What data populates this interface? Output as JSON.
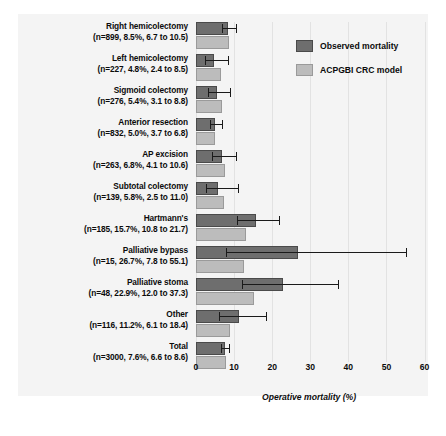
{
  "chart_data": {
    "type": "bar",
    "orientation": "horizontal",
    "title": "",
    "xlabel": "Operative mortality (%)",
    "ylabel": "",
    "xlim": [
      0,
      63
    ],
    "xticks": [
      0,
      10,
      20,
      30,
      40,
      50,
      60
    ],
    "grid": true,
    "legend_position": "top-right",
    "categories": [
      "Right hemicolectomy",
      "Left hemicolectomy",
      "Sigmoid colectomy",
      "Anterior resection",
      "AP excision",
      "Subtotal colectomy",
      "Hartmann's",
      "Palliative bypass",
      "Palliative stoma",
      "Other",
      "Total"
    ],
    "sublabels": [
      "(n=899, 8.5%, 6.7 to 10.5)",
      "(n=227, 4.8%, 2.4 to 8.5)",
      "(n=276, 5.4%, 3.1 to 8.8)",
      "(n=832, 5.0%, 3.7 to 6.8)",
      "(n=263, 6.8%, 4.1 to 10.6)",
      "(n=139, 5.8%, 2.5 to 11.0)",
      "(n=185, 15.7%, 10.8 to 21.7)",
      "(n=15, 26.7%, 7.8 to 55.1)",
      "(n=48, 22.9%, 12.0 to 37.3)",
      "(n=116, 11.2%, 6.1 to 18.4)",
      "(n=3000, 7.6%, 6.6 to 8.6)"
    ],
    "n": [
      899,
      227,
      276,
      832,
      263,
      139,
      185,
      15,
      48,
      116,
      3000
    ],
    "series": [
      {
        "name": "Observed mortality",
        "color": "#6e6e6e",
        "values": [
          8.5,
          4.8,
          5.4,
          5.0,
          6.8,
          5.8,
          15.7,
          26.7,
          22.9,
          11.2,
          7.6
        ],
        "ci_low": [
          6.7,
          2.4,
          3.1,
          3.7,
          4.1,
          2.5,
          10.8,
          7.8,
          12.0,
          6.1,
          6.6
        ],
        "ci_high": [
          10.5,
          8.5,
          8.8,
          6.8,
          10.6,
          11.0,
          21.7,
          55.1,
          37.3,
          18.4,
          8.6
        ]
      },
      {
        "name": "ACPGBI CRC model",
        "color": "#bcbcbc",
        "values": [
          8.6,
          6.6,
          6.9,
          5.1,
          7.5,
          7.4,
          13.1,
          12.6,
          15.2,
          8.9,
          8.0
        ]
      }
    ]
  },
  "legend": {
    "items": [
      {
        "label": "Observed mortality",
        "swatch": "observed"
      },
      {
        "label": "ACPGBI CRC model",
        "swatch": "model"
      }
    ]
  },
  "axis": {
    "tick_labels": [
      "0",
      "10",
      "20",
      "30",
      "40",
      "50",
      "60"
    ],
    "x_axis_title": "Operative mortality (%)"
  }
}
